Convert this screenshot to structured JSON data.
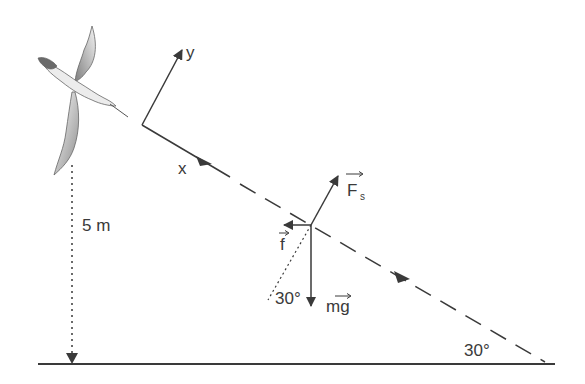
{
  "diagram": {
    "type": "free-body diagram of a gliding bird on an inclined path",
    "labels": {
      "y_axis": "y",
      "x_axis": "x",
      "height": "5 m",
      "spring_force": "F",
      "spring_force_sub": "s",
      "friction": "f",
      "weight": "mg",
      "angle_at_force": "30°",
      "angle_at_ground": "30°"
    },
    "colors": {
      "line": "#3a3a3a",
      "background": "#ffffff",
      "bird_shade": "#9a9a9a"
    }
  }
}
